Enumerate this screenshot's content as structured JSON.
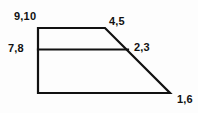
{
  "figure": {
    "stroke_color": "#111111",
    "background_color": "#fdfdfd",
    "stroke_width": 2.2,
    "outline_points": "38,28 105,28 170,93 38,93",
    "interior_line": {
      "x1": 38,
      "y1": 49.5,
      "x2": 128,
      "y2": 49.5
    },
    "labels": {
      "top_left": "9,10",
      "top_right": "4,5",
      "mid_left": "7,8",
      "mid_right": "2,3",
      "bottom_right": "1,6"
    }
  }
}
